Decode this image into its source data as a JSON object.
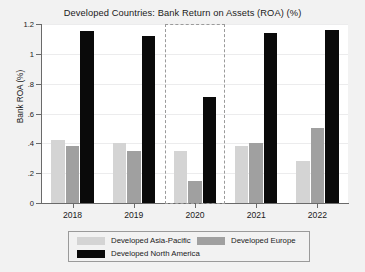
{
  "chart_data": {
    "type": "bar",
    "title": "Developed Countries: Bank Return on Assets (ROA) (%)",
    "xlabel": "",
    "ylabel": "Bank ROA (%)",
    "categories": [
      "2018",
      "2019",
      "2020",
      "2021",
      "2022"
    ],
    "series": [
      {
        "name": "Developed Asia-Pacific",
        "color": "#d4d4d4",
        "values": [
          0.42,
          0.4,
          0.35,
          0.38,
          0.28
        ]
      },
      {
        "name": "Developed Europe",
        "color": "#a0a0a0",
        "values": [
          0.38,
          0.35,
          0.15,
          0.4,
          0.5
        ]
      },
      {
        "name": "Developed North America",
        "color": "#0a0a0a",
        "values": [
          1.15,
          1.12,
          0.71,
          1.14,
          1.16
        ]
      }
    ],
    "ylim": [
      0,
      1.2
    ],
    "yticks": [
      0,
      0.2,
      0.4,
      0.6,
      0.8,
      1.0,
      1.2
    ],
    "ytick_labels": [
      "0",
      ".2",
      ".4",
      ".6",
      ".8",
      "1",
      "1.2"
    ],
    "grid": true,
    "legend_position": "bottom",
    "annotations": [
      {
        "type": "highlight-box",
        "style": "dashed",
        "category": "2020",
        "color": "#9a9a9a"
      }
    ]
  },
  "colors": {
    "figure_background": "#f2f2f2",
    "plot_background": "#ffffff",
    "axis": "#6a6a6a",
    "gridline": "#ececed",
    "text": "#1a1a1a",
    "highlight": "#9a9a9a"
  }
}
